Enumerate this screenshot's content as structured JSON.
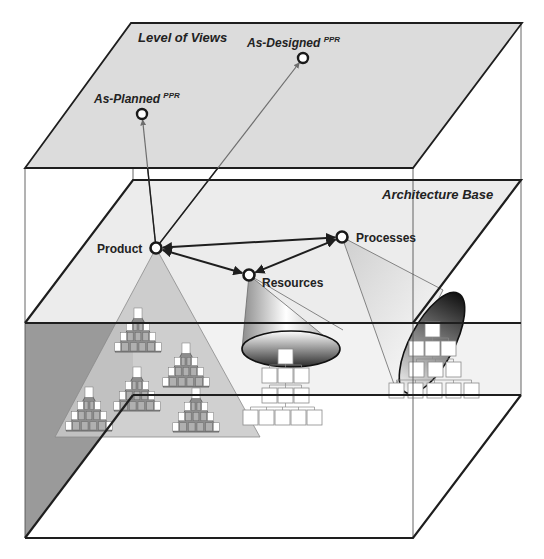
{
  "diagram": {
    "width": 544,
    "height": 559,
    "colors": {
      "background": "#ffffff",
      "plane_top": "#dcdcdc",
      "plane_middle": "#ececec",
      "plane_bottom": "#ffffff",
      "back_wall_left": "#9a9a9a",
      "back_wall_left_mid": "#b4b4b4",
      "back_wall_right": "#f2f2f2",
      "edge": "#1e1e1e",
      "thin_edge": "#555555",
      "arrow_view": "#6e6e6e",
      "arrow_base": "#1e1e1e",
      "node_fill": "#ffffff",
      "node_stroke": "#1a1a1a",
      "product_triangle": "#c8c8c8",
      "mini_pyramid": "#8c8c8c",
      "mini_cell": "#b0b0b0",
      "org_box_fill": "#ffffff",
      "org_box_stroke": "#8a8a8a",
      "label": "#222222"
    },
    "planes": {
      "top": {
        "name": "Level of Views",
        "label": "Level of Views",
        "label_pos": [
          138,
          42
        ],
        "points": [
          [
            131,
            23
          ],
          [
            522,
            23
          ],
          [
            413,
            168
          ],
          [
            25,
            168
          ]
        ]
      },
      "middle": {
        "name": "Architecture Base",
        "label": "Architecture Base",
        "label_pos": [
          382,
          199
        ],
        "points": [
          [
            133,
            180
          ],
          [
            521,
            180
          ],
          [
            413,
            323
          ],
          [
            25,
            323
          ]
        ]
      },
      "bottom": {
        "points": [
          [
            133,
            395
          ],
          [
            521,
            395
          ],
          [
            413,
            538
          ],
          [
            25,
            538
          ]
        ]
      }
    },
    "box": {
      "back_left_x": 133,
      "back_right_x": 521,
      "front_left_x": 25,
      "front_right_x": 413,
      "top_y": 168,
      "bottom_y": 538
    },
    "view_nodes": [
      {
        "id": "as-planned",
        "label": "As-Planned",
        "sup": "PPR",
        "cx": 142,
        "cy": 114,
        "label_x": 94,
        "label_y": 103
      },
      {
        "id": "as-designed",
        "label": "As-Designed",
        "sup": "PPR",
        "cx": 303,
        "cy": 58,
        "label_x": 247,
        "label_y": 47
      }
    ],
    "base_nodes": [
      {
        "id": "product",
        "label": "Product",
        "cx": 156,
        "cy": 248,
        "label_x": 97,
        "label_y": 253
      },
      {
        "id": "resources",
        "label": "Resources",
        "cx": 249,
        "cy": 275,
        "label_x": 262,
        "label_y": 287
      },
      {
        "id": "processes",
        "label": "Processes",
        "cx": 342,
        "cy": 237,
        "label_x": 356,
        "label_y": 242
      }
    ],
    "view_links": [
      {
        "from": "product",
        "to": "as-planned"
      },
      {
        "from": "product",
        "to": "as-designed"
      }
    ],
    "base_links": [
      {
        "from": "product",
        "to": "processes",
        "bidirectional": true
      },
      {
        "from": "product",
        "to": "resources",
        "bidirectional": true
      },
      {
        "from": "resources",
        "to": "processes",
        "bidirectional": true
      }
    ],
    "product_triangle": {
      "apex": [
        156,
        248
      ],
      "base_left": [
        55,
        437
      ],
      "base_right": [
        260,
        437
      ]
    },
    "mini_pyramids": [
      {
        "apex": [
          138,
          311
        ],
        "base_y": 352,
        "half_width": 23
      },
      {
        "apex": [
          186,
          346
        ],
        "base_y": 387,
        "half_width": 23
      },
      {
        "apex": [
          137,
          370
        ],
        "base_y": 411,
        "half_width": 23
      },
      {
        "apex": [
          89,
          390
        ],
        "base_y": 431,
        "half_width": 23
      },
      {
        "apex": [
          196,
          391
        ],
        "base_y": 432,
        "half_width": 23
      }
    ],
    "resources_cone": {
      "apex": [
        249,
        275
      ],
      "ellipse_cx": 291,
      "ellipse_cy": 349,
      "rx": 49,
      "ry": 18,
      "rotate": 0
    },
    "processes_cone": {
      "apex": [
        342,
        237
      ],
      "ellipse_cx": 432,
      "ellipse_cy": 343,
      "rx": 22,
      "ry": 56,
      "rotate": 28
    },
    "resources_org_chart": {
      "box_size": 15,
      "rows": [
        {
          "y": 349,
          "xs": [
            278
          ]
        },
        {
          "y": 368,
          "xs": [
            262,
            278,
            294
          ]
        },
        {
          "y": 388,
          "xs": [
            262,
            278,
            294
          ]
        },
        {
          "y": 410,
          "xs": [
            243,
            259,
            275,
            291,
            307
          ]
        }
      ]
    },
    "processes_org_chart": {
      "box_size": 15,
      "rows": [
        {
          "y": 322,
          "xs": [
            425
          ]
        },
        {
          "y": 341,
          "xs": [
            409,
            425,
            441
          ]
        },
        {
          "y": 362,
          "xs": [
            409,
            428,
            446
          ]
        },
        {
          "y": 383,
          "xs": [
            389,
            408,
            427,
            446,
            464
          ]
        }
      ]
    }
  }
}
